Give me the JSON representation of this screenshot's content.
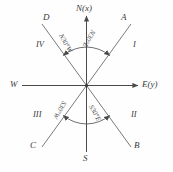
{
  "figure": {
    "type": "compass-bearing-diagram",
    "background_color": "#fefefe",
    "line_color": "#555555",
    "text_color": "#3a3a3a"
  },
  "axes": {
    "north": {
      "label": "N(x)",
      "direction": "up"
    },
    "east": {
      "label": "E(y)",
      "direction": "right"
    },
    "west": {
      "label": "W",
      "direction": "left"
    },
    "south": {
      "label": "S",
      "direction": "down"
    }
  },
  "rays": [
    {
      "name": "A",
      "label": "A",
      "quadrant": "upper-right",
      "bearing": "N30°E"
    },
    {
      "name": "B",
      "label": "B",
      "quadrant": "lower-right",
      "bearing": "S30°E"
    },
    {
      "name": "C",
      "label": "C",
      "quadrant": "lower-left",
      "bearing": "S30°W"
    },
    {
      "name": "D",
      "label": "D",
      "quadrant": "upper-left",
      "bearing": "N30°W"
    }
  ],
  "quadrants": [
    {
      "numeral": "I",
      "position": "upper-right"
    },
    {
      "numeral": "II",
      "position": "lower-right"
    },
    {
      "numeral": "III",
      "position": "lower-left"
    },
    {
      "numeral": "IV",
      "position": "upper-left"
    }
  ],
  "bearings": [
    {
      "text": "N30°W",
      "angle_deg": 30,
      "from": "N",
      "toward": "W"
    },
    {
      "text": "N30°E",
      "angle_deg": 30,
      "from": "N",
      "toward": "E"
    },
    {
      "text": "S30°W",
      "angle_deg": 30,
      "from": "S",
      "toward": "W"
    },
    {
      "text": "S30°E",
      "angle_deg": 30,
      "from": "S",
      "toward": "E"
    }
  ]
}
